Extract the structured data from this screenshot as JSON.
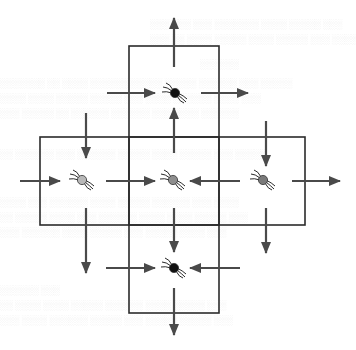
{
  "diagram": {
    "colors": {
      "background": "#ffffff",
      "box_stroke": "#2b2b2b",
      "arrow": "#4a4a4a",
      "spider_dark": "#111111",
      "spider_light": "#b8b8b8",
      "spider_mid": "#8e8e8e",
      "spider_right": "#7a7a7a"
    },
    "cells": [
      {
        "id": "top",
        "x": 129,
        "y": 46,
        "w": 90,
        "h": 91,
        "spider": "dark"
      },
      {
        "id": "left",
        "x": 40,
        "y": 137,
        "w": 89,
        "h": 88,
        "spider": "light"
      },
      {
        "id": "center",
        "x": 129,
        "y": 137,
        "w": 90,
        "h": 88,
        "spider": "mid"
      },
      {
        "id": "right",
        "x": 219,
        "y": 137,
        "w": 86,
        "h": 88,
        "spider": "right"
      },
      {
        "id": "bottom",
        "x": 129,
        "y": 225,
        "w": 90,
        "h": 88,
        "spider": "dark"
      }
    ],
    "spiders": [
      {
        "cell": "top",
        "cx": 175,
        "cy": 93,
        "shade": "dark"
      },
      {
        "cell": "left",
        "cx": 82,
        "cy": 180,
        "shade": "light"
      },
      {
        "cell": "center",
        "cx": 173,
        "cy": 180,
        "shade": "mid"
      },
      {
        "cell": "right",
        "cx": 263,
        "cy": 180,
        "shade": "right"
      },
      {
        "cell": "bottom",
        "cx": 174,
        "cy": 268,
        "shade": "dark"
      }
    ],
    "arrows": [
      {
        "id": "top-out-up",
        "x1": 174,
        "y1": 67,
        "x2": 174,
        "y2": 18
      },
      {
        "id": "top-in-from-left",
        "x1": 107,
        "y1": 93,
        "x2": 155,
        "y2": 93
      },
      {
        "id": "top-out-right",
        "x1": 201,
        "y1": 93,
        "x2": 248,
        "y2": 93
      },
      {
        "id": "center-to-top",
        "x1": 174,
        "y1": 153,
        "x2": 174,
        "y2": 108
      },
      {
        "id": "left-down-upper",
        "x1": 86,
        "y1": 113,
        "x2": 86,
        "y2": 158
      },
      {
        "id": "right-down-upper",
        "x1": 266,
        "y1": 121,
        "x2": 266,
        "y2": 166
      },
      {
        "id": "left-in-from-left",
        "x1": 20,
        "y1": 181,
        "x2": 60,
        "y2": 181
      },
      {
        "id": "left-to-center",
        "x1": 106,
        "y1": 181,
        "x2": 155,
        "y2": 181
      },
      {
        "id": "right-to-center",
        "x1": 240,
        "y1": 181,
        "x2": 190,
        "y2": 181
      },
      {
        "id": "right-out-right",
        "x1": 292,
        "y1": 181,
        "x2": 340,
        "y2": 181
      },
      {
        "id": "left-down-lower",
        "x1": 86,
        "y1": 208,
        "x2": 86,
        "y2": 273
      },
      {
        "id": "center-to-bottom",
        "x1": 174,
        "y1": 208,
        "x2": 174,
        "y2": 252
      },
      {
        "id": "right-down-lower",
        "x1": 266,
        "y1": 208,
        "x2": 266,
        "y2": 253
      },
      {
        "id": "bottom-in-from-left",
        "x1": 106,
        "y1": 268,
        "x2": 155,
        "y2": 268
      },
      {
        "id": "bottom-in-from-right",
        "x1": 240,
        "y1": 268,
        "x2": 190,
        "y2": 268
      },
      {
        "id": "bottom-out-down",
        "x1": 174,
        "y1": 288,
        "x2": 174,
        "y2": 335
      }
    ]
  }
}
